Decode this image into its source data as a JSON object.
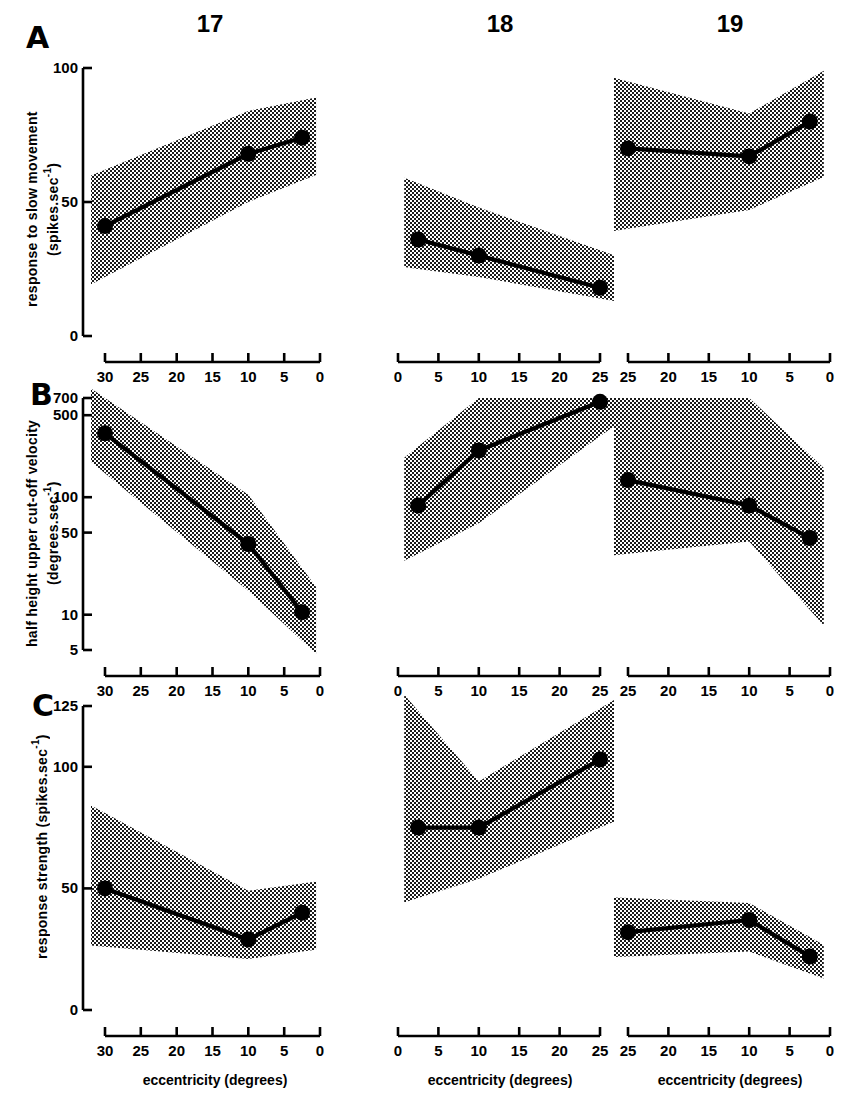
{
  "figure": {
    "column_headers": [
      "17",
      "18",
      "19"
    ],
    "panel_letters": [
      "A",
      "B",
      "C"
    ],
    "xlabel": "eccentricity (degrees)"
  },
  "chart_data": {
    "type": "line",
    "title": "",
    "layout": {
      "rows": 3,
      "cols": 3,
      "grid": false,
      "legend": "none",
      "band_meaning": "shaded range (stippled) around mean line"
    },
    "columns": [
      {
        "header": "17",
        "xlabel": "eccentricity (degrees)",
        "xticks": [
          30,
          25,
          20,
          15,
          10,
          5,
          0
        ],
        "xlim": [
          30,
          0
        ],
        "x_reversed": true
      },
      {
        "header": "18",
        "xlabel": "eccentricity (degrees)",
        "xticks": [
          0,
          5,
          10,
          15,
          20,
          25
        ],
        "xlim": [
          0,
          25
        ],
        "x_reversed": false
      },
      {
        "header": "19",
        "xlabel": "eccentricity (degrees)",
        "xticks": [
          25,
          20,
          15,
          10,
          5,
          0
        ],
        "xlim": [
          25,
          0
        ],
        "x_reversed": true
      }
    ],
    "rows": [
      {
        "panel": "A",
        "ylabel": "response to slow movement (spikes.sec-1)",
        "ylabel_line1": "response to slow movement",
        "ylabel_line2": "(spikes.sec",
        "ylabel_sup": "-1",
        "ylabel_tail": ")",
        "yscale": "linear",
        "yticks": [
          0,
          50,
          100
        ],
        "ylim": [
          0,
          100
        ],
        "panels": [
          {
            "column": "17",
            "x": [
              30,
              10,
              2.5
            ],
            "values": [
              41,
              68,
              74
            ],
            "band_upper": [
              62,
              84,
              88
            ],
            "band_lower": [
              22,
              50,
              58
            ]
          },
          {
            "column": "18",
            "x": [
              2.5,
              10,
              25
            ],
            "values": [
              36,
              30,
              18
            ],
            "band_upper": [
              57,
              48,
              32
            ],
            "band_lower": [
              25,
              22,
              14
            ]
          },
          {
            "column": "19",
            "x": [
              25,
              10,
              2.5
            ],
            "values": [
              70,
              67,
              80
            ],
            "band_upper": [
              95,
              83,
              96
            ],
            "band_lower": [
              40,
              47,
              57
            ]
          }
        ]
      },
      {
        "panel": "B",
        "ylabel": "half height upper cut-off velocity (degrees.sec-1)",
        "ylabel_line1": "half height upper cut-off velocity",
        "ylabel_line2": "(degrees.sec",
        "ylabel_sup": "-1",
        "ylabel_tail": ")",
        "yscale": "log",
        "yticks": [
          5,
          10,
          50,
          100,
          500,
          700
        ],
        "ylim": [
          5,
          700
        ],
        "panels": [
          {
            "column": "17",
            "x": [
              30,
              10,
              2.5
            ],
            "values": [
              350,
              40,
              10.5
            ],
            "band_upper": [
              700,
              105,
              25
            ],
            "band_lower": [
              160,
              16,
              6
            ]
          },
          {
            "column": "18",
            "x": [
              2.5,
              10,
              25
            ],
            "values": [
              85,
              250,
              650
            ],
            "band_upper": [
              270,
              700,
              700
            ],
            "band_lower": [
              33,
              60,
              330
            ]
          },
          {
            "column": "19",
            "x": [
              25,
              10,
              2.5
            ],
            "values": [
              140,
              85,
              45
            ],
            "band_upper": [
              700,
              700,
              230
            ],
            "band_lower": [
              33,
              42,
              11
            ]
          }
        ]
      },
      {
        "panel": "C",
        "ylabel": "response strength (spikes.sec-1)",
        "ylabel_line1": "response strength (spikes.sec",
        "ylabel_sup": "-1",
        "ylabel_tail": ")",
        "yscale": "linear",
        "yticks": [
          0,
          50,
          100,
          125
        ],
        "ylim": [
          0,
          125
        ],
        "panels": [
          {
            "column": "17",
            "x": [
              30,
              10,
              2.5
            ],
            "values": [
              50,
              29,
              40
            ],
            "band_upper": [
              81,
              49,
              52
            ],
            "band_lower": [
              26,
              21,
              24
            ]
          },
          {
            "column": "18",
            "x": [
              2.5,
              10,
              25
            ],
            "values": [
              75,
              75,
              103
            ],
            "band_upper": [
              123,
              94,
              124
            ],
            "band_lower": [
              46,
              54,
              75
            ]
          },
          {
            "column": "19",
            "x": [
              25,
              10,
              2.5
            ],
            "values": [
              32,
              37,
              22
            ],
            "band_upper": [
              46,
              44,
              30
            ],
            "band_lower": [
              22,
              24,
              15
            ]
          }
        ]
      }
    ]
  }
}
